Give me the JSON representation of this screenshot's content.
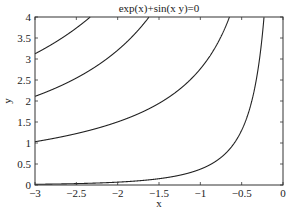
{
  "chart_data": {
    "type": "line",
    "title": "exp(x)+sin(x y)=0",
    "xlabel": "x",
    "ylabel": "y",
    "xlim": [
      -3,
      0
    ],
    "ylim": [
      0,
      4
    ],
    "grid": false,
    "legend": null,
    "xticks": [
      "-3",
      "-2.5",
      "-2",
      "-1.5",
      "-1",
      "-0.5",
      "0"
    ],
    "yticks": [
      "0",
      "0.5",
      "1",
      "1.5",
      "2",
      "2.5",
      "3",
      "3.5",
      "4"
    ],
    "series": [
      {
        "name": "branch 1",
        "points": [
          [
            -3,
            0.017
          ],
          [
            -2.5,
            0.033
          ],
          [
            -2,
            0.068
          ],
          [
            -1.5,
            0.15
          ],
          [
            -1,
            0.377
          ],
          [
            -0.5,
            1.39
          ],
          [
            -0.3,
            3.2
          ],
          [
            -0.25,
            4.0
          ]
        ]
      },
      {
        "name": "branch 2",
        "points": [
          [
            -3,
            1.03
          ],
          [
            -2.5,
            1.22
          ],
          [
            -2,
            1.5
          ],
          [
            -1.5,
            1.95
          ],
          [
            -1,
            2.76
          ],
          [
            -0.8,
            3.5
          ],
          [
            -0.64,
            4.0
          ]
        ]
      },
      {
        "name": "branch 3",
        "points": [
          [
            -3,
            2.11
          ],
          [
            -2.5,
            2.55
          ],
          [
            -2,
            3.21
          ],
          [
            -1.7,
            3.8
          ],
          [
            -1.62,
            4.0
          ]
        ]
      },
      {
        "name": "branch 4",
        "points": [
          [
            -3,
            3.13
          ],
          [
            -2.7,
            3.5
          ],
          [
            -2.4,
            3.95
          ],
          [
            -2.34,
            4.0
          ]
        ]
      }
    ]
  },
  "labels": {
    "title": "exp(x)+sin(x y)=0",
    "xlabel": "x",
    "ylabel": "y"
  }
}
